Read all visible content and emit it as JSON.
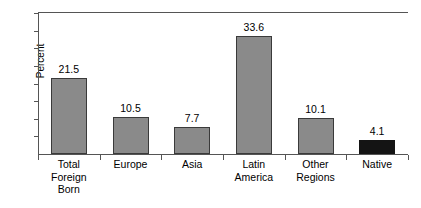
{
  "chart_data": {
    "type": "bar",
    "title": "",
    "subtitle": "",
    "xlabel": "",
    "ylabel": "Percent",
    "ylim": [
      0,
      40
    ],
    "grid": false,
    "legend": "none",
    "y_tick_labels": [],
    "y_ticks_unlabeled": true,
    "categories": [
      "Total Foreign Born",
      "Europe",
      "Asia",
      "Latin America",
      "Other Regions",
      "Native"
    ],
    "category_lines": [
      [
        "Total",
        "Foreign",
        "Born"
      ],
      [
        "Europe"
      ],
      [
        "Asia"
      ],
      [
        "Latin",
        "America"
      ],
      [
        "Other",
        "Regions"
      ],
      [
        "Native"
      ]
    ],
    "values": [
      21.5,
      10.5,
      7.7,
      33.6,
      10.1,
      4.1
    ],
    "value_labels": [
      "21.5",
      "10.5",
      "7.7",
      "33.6",
      "10.1",
      "4.1"
    ],
    "bar_colors": [
      "#8a8a8a",
      "#8a8a8a",
      "#8a8a8a",
      "#8a8a8a",
      "#8a8a8a",
      "#141414"
    ],
    "axis_color": "#555555",
    "text_color": "#000000",
    "background": "#ffffff"
  }
}
